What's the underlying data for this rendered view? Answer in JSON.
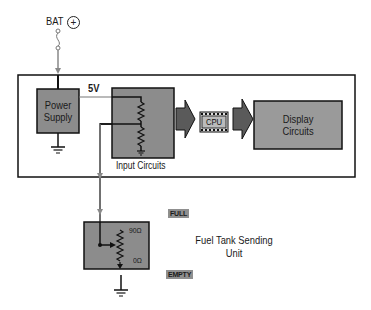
{
  "diagram": {
    "battery": {
      "label": "BAT",
      "symbol": "+"
    },
    "supply_voltage_label": "5V",
    "blocks": {
      "power_supply": {
        "line1": "Power",
        "line2": "Supply"
      },
      "input_circuits": {
        "label": "Input Circuits"
      },
      "cpu": {
        "label": "CPU"
      },
      "display_circuits": {
        "line1": "Display",
        "line2": "Circuits"
      },
      "sending_unit": {
        "title_line1": "Fuel Tank Sending",
        "title_line2": "Unit",
        "resistance_top": "90Ω",
        "resistance_bottom": "0Ω",
        "full_label": "FULL",
        "empty_label": "EMPTY"
      }
    },
    "colors": {
      "block_fill": "#8c8c8c",
      "display_fill": "#9a9a9a",
      "arrow_fill": "#5a5a5a",
      "wire": "#1a1a1a",
      "signal_wire": "#8a8a8a",
      "outline": "#111111"
    }
  }
}
